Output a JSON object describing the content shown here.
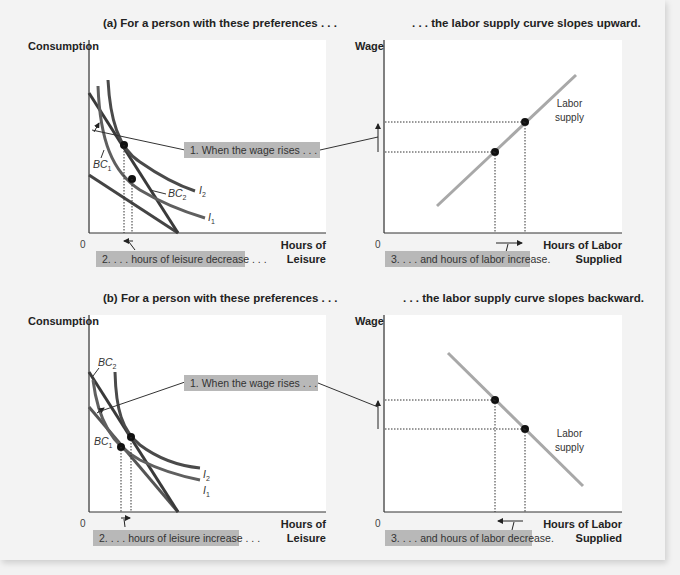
{
  "panel_a": {
    "left_title": "(a) For a person with these preferences . . .",
    "right_title": ". . . the labor supply curve slopes upward.",
    "left_chart": {
      "y_label": "Consumption",
      "x_label_line1": "Hours of",
      "x_label_line2": "Leisure",
      "origin": "0",
      "curves": {
        "bc1": "BC",
        "bc1_sub": "1",
        "bc2": "BC",
        "bc2_sub": "2",
        "i1": "I",
        "i1_sub": "1",
        "i2": "I",
        "i2_sub": "2"
      },
      "callout_wage": "1. When the wage rises . . .",
      "callout_leisure": "2. . . . hours of leisure decrease . . ."
    },
    "right_chart": {
      "y_label": "Wage",
      "x_label_line1": "Hours of Labor",
      "x_label_line2": "Supplied",
      "origin": "0",
      "supply_label_line1": "Labor",
      "supply_label_line2": "supply",
      "callout_labor": "3. . . . and hours of labor increase."
    }
  },
  "panel_b": {
    "left_title": "(b) For a person with these preferences . . .",
    "right_title": ". . . the labor supply curve slopes backward.",
    "left_chart": {
      "y_label": "Consumption",
      "x_label_line1": "Hours of",
      "x_label_line2": "Leisure",
      "origin": "0",
      "curves": {
        "bc1": "BC",
        "bc1_sub": "1",
        "bc2": "BC",
        "bc2_sub": "2",
        "i1": "I",
        "i1_sub": "1",
        "i2": "I",
        "i2_sub": "2"
      },
      "callout_wage": "1. When the wage rises . . .",
      "callout_leisure": "2. . . . hours of leisure increase . . ."
    },
    "right_chart": {
      "y_label": "Wage",
      "x_label_line1": "Hours of Labor",
      "x_label_line2": "Supplied",
      "origin": "0",
      "supply_label_line1": "Labor",
      "supply_label_line2": "supply",
      "callout_labor": "3. . . . and hours of labor decrease."
    }
  },
  "colors": {
    "indifference_curve": "#5a5a5a",
    "budget_constraint": "#3a3a3a",
    "labor_supply": "#a8a8a8",
    "callout_bg": "#b8b8b8",
    "plot_bg": "#ffffff",
    "page_bg": "#f3f3f3"
  }
}
